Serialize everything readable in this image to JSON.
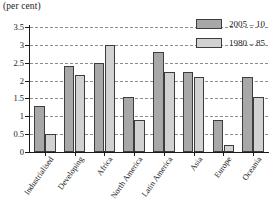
{
  "chart_data": {
    "type": "bar",
    "title": "",
    "unit_caption": "(per cent)",
    "xlabel": "",
    "ylabel": "",
    "ylim": [
      0,
      3.5
    ],
    "ytick_labels": [
      "3.5",
      "3",
      "2.5",
      "2",
      "1.5",
      "1",
      "0.5",
      "0"
    ],
    "ytick_values": [
      3.5,
      3,
      2.5,
      2,
      1.5,
      1,
      0.5,
      0
    ],
    "grid": "horizontal-dashed",
    "legend_position": "top-right",
    "categories": [
      "Industrialised",
      "Developing",
      "Africa",
      "North America",
      "Latin America",
      "Asia",
      "Europe",
      "Oceania"
    ],
    "series": [
      {
        "name": "2005 – 10",
        "color": "#a8a8a8",
        "values": [
          1.3,
          2.4,
          2.5,
          1.55,
          2.8,
          2.25,
          0.9,
          2.1
        ]
      },
      {
        "name": "1980 – 85",
        "color": "#d2d2d2",
        "values": [
          0.5,
          2.15,
          3.0,
          0.9,
          2.25,
          2.1,
          0.2,
          1.55
        ]
      }
    ]
  },
  "legend": {
    "items": [
      {
        "label": "2005 – 10",
        "swatch": "s0"
      },
      {
        "label": "1980 – 85",
        "swatch": "s1"
      }
    ]
  }
}
